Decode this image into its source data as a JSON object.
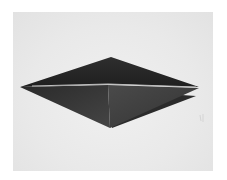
{
  "image": {
    "description": "Black-and-white photo of a dark folded paper (origami) in a flattened diamond shape on a light gray background",
    "colors": {
      "background": "#ffffff",
      "photo_background": "#e9e9e9",
      "paper_top": "#2a2a2a",
      "paper_bottom": "#3c3c3c",
      "crease_highlight": "#bdbdbd"
    }
  }
}
